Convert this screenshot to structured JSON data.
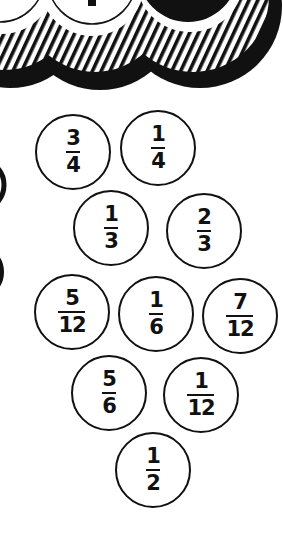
{
  "colors": {
    "ink": "#111111",
    "paper": "#ffffff"
  },
  "decoration": {
    "top_band": "scalloped-striped-3d-rings",
    "left_edge_arcs": 2
  },
  "fractions": [
    {
      "numerator": "3",
      "denominator": "4",
      "cx": 73,
      "cy": 152,
      "r": 38
    },
    {
      "numerator": "1",
      "denominator": "4",
      "cx": 158,
      "cy": 148,
      "r": 38
    },
    {
      "numerator": "1",
      "denominator": "3",
      "cx": 111,
      "cy": 228,
      "r": 38
    },
    {
      "numerator": "2",
      "denominator": "3",
      "cx": 204,
      "cy": 231,
      "r": 38
    },
    {
      "numerator": "5",
      "denominator": "12",
      "cx": 72,
      "cy": 312,
      "r": 38
    },
    {
      "numerator": "1",
      "denominator": "6",
      "cx": 156,
      "cy": 314,
      "r": 38
    },
    {
      "numerator": "7",
      "denominator": "12",
      "cx": 240,
      "cy": 316,
      "r": 38
    },
    {
      "numerator": "5",
      "denominator": "6",
      "cx": 109,
      "cy": 393,
      "r": 38
    },
    {
      "numerator": "1",
      "denominator": "12",
      "cx": 201,
      "cy": 395,
      "r": 38
    },
    {
      "numerator": "1",
      "denominator": "2",
      "cx": 153,
      "cy": 470,
      "r": 38
    }
  ]
}
